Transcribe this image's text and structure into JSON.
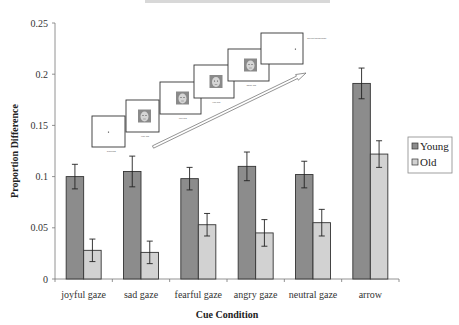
{
  "chart_data": {
    "type": "bar",
    "title": "",
    "xlabel": "Cue Condition",
    "ylabel": "Proportion Difference",
    "ylim": [
      0,
      0.25
    ],
    "yticks": [
      0,
      0.05,
      0.1,
      0.15,
      0.2,
      0.25
    ],
    "ytick_labels": [
      "0",
      "0.05",
      "0.1",
      "0.15",
      "0.2",
      "0.25"
    ],
    "grid": false,
    "legend_position": "right",
    "categories": [
      "joyful gaze",
      "sad gaze",
      "fearful gaze",
      "angry gaze",
      "neutral gaze",
      "arrow"
    ],
    "series": [
      {
        "name": "Young",
        "color": "#8c8c8c",
        "values": [
          0.1,
          0.105,
          0.098,
          0.11,
          0.102,
          0.191
        ],
        "errors": [
          0.012,
          0.015,
          0.011,
          0.014,
          0.013,
          0.015
        ]
      },
      {
        "name": "Old",
        "color": "#d2d2d2",
        "values": [
          0.028,
          0.026,
          0.053,
          0.045,
          0.055,
          0.122
        ],
        "errors": [
          0.011,
          0.011,
          0.011,
          0.013,
          0.013,
          0.013
        ]
      }
    ],
    "inset": {
      "description": "Trial sequence schematic: fixation, cue faces, target screen",
      "screens": [
        {
          "content": "fixation",
          "duration": "1000ms"
        },
        {
          "content": "face",
          "duration": "400 ms"
        },
        {
          "content": "face",
          "duration": "400 ms"
        },
        {
          "content": "face",
          "duration": "400 ms"
        },
        {
          "content": "face",
          "duration": "1500 ms"
        },
        {
          "content": "target",
          "label": "Covert Response"
        }
      ]
    }
  }
}
